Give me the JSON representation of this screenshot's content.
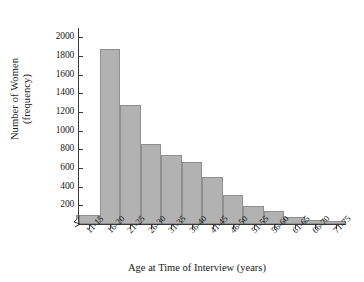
{
  "chart_data": {
    "type": "bar",
    "title": "",
    "subtitle": "",
    "xlabel": "Age at Time of Interview (years)",
    "ylabel_line1": "Number of Women",
    "ylabel_line2": "(frequency)",
    "categories": [
      "11-15",
      "16-20",
      "21-25",
      "26-30",
      "31-35",
      "36-40",
      "41-45",
      "46-50",
      "51-55",
      "56-60",
      "61-65",
      "66-70",
      "71-75"
    ],
    "values": [
      100,
      1880,
      1280,
      860,
      740,
      660,
      500,
      310,
      195,
      140,
      75,
      45,
      30
    ],
    "ylim": [
      0,
      2100
    ],
    "ytick_values": [
      200,
      400,
      600,
      800,
      1000,
      1200,
      1400,
      1600,
      1800,
      2000
    ],
    "ytick_labels": [
      "200",
      "400",
      "600",
      "800",
      "1000",
      "1200",
      "1400",
      "1600",
      "1800",
      "2000"
    ],
    "grid": false,
    "legend": false,
    "legend_position": "none",
    "bar_fill_color": "#b2b2b2",
    "bar_edge_color": "#8f8f8f",
    "axis_color": "#3a3a3a",
    "axis_break": true,
    "axis_break_symbol": "zigzag"
  }
}
